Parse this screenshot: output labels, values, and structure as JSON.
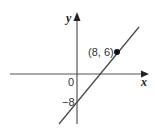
{
  "diagram": {
    "x_axis_label": "x",
    "y_axis_label": "y",
    "origin_label": "0",
    "y_intercept_label": "−8",
    "point_label": "(8, 6)",
    "point": {
      "x": 8,
      "y": 6
    },
    "y_intercept": -8,
    "line_color": "#444444",
    "axis_color": "#555555"
  }
}
